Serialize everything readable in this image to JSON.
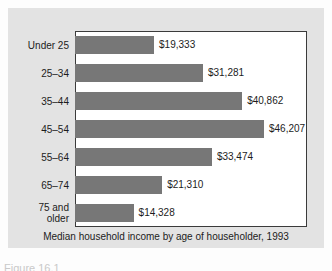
{
  "chart_data": {
    "type": "bar",
    "orientation": "horizontal",
    "title": "",
    "caption": "Median household income by age of householder, 1993",
    "xlabel": "",
    "ylabel": "",
    "categories": [
      "Under 25",
      "25–34",
      "35–44",
      "45–54",
      "55–64",
      "65–74",
      "75 and older"
    ],
    "category_lines": [
      [
        "Under 25"
      ],
      [
        "25–34"
      ],
      [
        "35–44"
      ],
      [
        "45–54"
      ],
      [
        "55–64"
      ],
      [
        "65–74"
      ],
      [
        "75 and",
        "older"
      ]
    ],
    "values": [
      19333,
      31281,
      40862,
      46207,
      33474,
      21310,
      14328
    ],
    "value_labels": [
      "$19,333",
      "$31,281",
      "$40,862",
      "$46,207",
      "$33,474",
      "$21,310",
      "$14,328"
    ],
    "xlim": [
      0,
      46207
    ],
    "grid": false,
    "legend": null,
    "bar_color": "#777777",
    "panel_color": "#e3e3e3",
    "plot_background": "#ffffff",
    "frame_color": "#3b3b3b",
    "text_color": "#1c1c1c"
  },
  "figure": {
    "bottom_cut_text": "Figure 16.1"
  }
}
